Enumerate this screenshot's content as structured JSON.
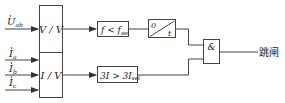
{
  "diagram": {
    "type": "protection-logic-block-diagram",
    "colors": {
      "line": "#444444",
      "text": "#222222",
      "background": "#ffffff"
    },
    "inputs": [
      {
        "id": "uab",
        "symbol": "U",
        "subscript": "ab",
        "dot": true
      },
      {
        "id": "ia",
        "symbol": "I",
        "subscript": "a",
        "dot": true
      },
      {
        "id": "ib",
        "symbol": "I",
        "subscript": "b",
        "dot": true
      },
      {
        "id": "ic",
        "symbol": "I",
        "subscript": "c",
        "dot": true
      }
    ],
    "converters": {
      "voltage": {
        "label": "V / V"
      },
      "current": {
        "label": "I / V"
      }
    },
    "comparators": {
      "frequency": {
        "main": "f < f",
        "subscript": "set"
      },
      "current": {
        "main": "3I > 3I",
        "subscript": "set"
      }
    },
    "timer": {
      "start": "0",
      "end": "t"
    },
    "and_gate": {
      "label": "&"
    },
    "output": {
      "label": "跳闸"
    }
  }
}
